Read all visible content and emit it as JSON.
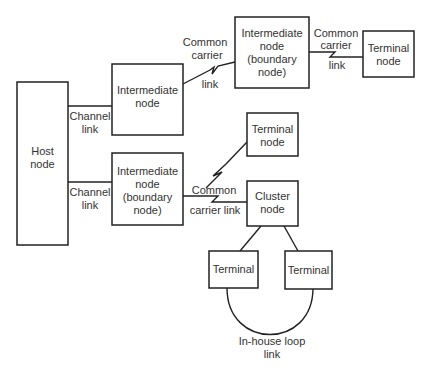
{
  "diagram": {
    "type": "network-topology",
    "nodes": {
      "host": {
        "lines": [
          "Host",
          "node"
        ]
      },
      "intermediate_top": {
        "lines": [
          "Intermediate",
          "node"
        ]
      },
      "intermediate_bottom": {
        "lines": [
          "Intermediate",
          "node",
          "(boundary",
          "node)"
        ]
      },
      "intermediate_boundary_top": {
        "lines": [
          "Intermediate",
          "node",
          "(boundary",
          "node)"
        ]
      },
      "terminal_node_top": {
        "lines": [
          "Terminal",
          "node"
        ]
      },
      "terminal_node_middle": {
        "lines": [
          "Terminal",
          "node"
        ]
      },
      "cluster": {
        "lines": [
          "Cluster",
          "node"
        ]
      },
      "terminal_left": {
        "lines": [
          "Terminal"
        ]
      },
      "terminal_right": {
        "lines": [
          "Terminal"
        ]
      }
    },
    "links": {
      "channel_top": {
        "lines": [
          "Channel",
          "link"
        ]
      },
      "channel_bottom": {
        "lines": [
          "Channel",
          "link"
        ]
      },
      "common_carrier_upper": {
        "lines": [
          "Common",
          "carrier",
          "link"
        ]
      },
      "common_carrier_right": {
        "lines": [
          "Common",
          "carrier",
          "link"
        ]
      },
      "common_carrier_lower": {
        "lines": [
          "Common",
          "carrier link"
        ]
      },
      "loop": {
        "lines": [
          "In-house loop",
          "link"
        ]
      }
    }
  }
}
